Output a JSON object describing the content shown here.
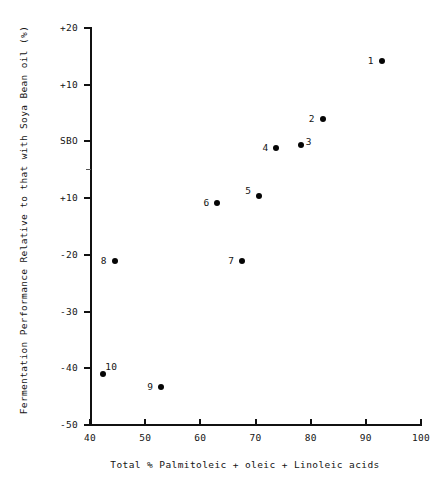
{
  "chart_data": {
    "type": "scatter",
    "title": "",
    "xlabel": "Total % Palmitoleic + oleic + Linoleic acids",
    "ylabel": "Fermentation Performance Relative to that with Soya Bean oil (%)",
    "xlim": [
      40,
      100
    ],
    "ylim": [
      -50,
      20
    ],
    "grid": false,
    "legend": null,
    "xticks": [
      {
        "value": 40,
        "label": "40"
      },
      {
        "value": 50,
        "label": "50"
      },
      {
        "value": 60,
        "label": "60"
      },
      {
        "value": 70,
        "label": "70"
      },
      {
        "value": 80,
        "label": "80"
      },
      {
        "value": 90,
        "label": "90"
      },
      {
        "value": 100,
        "label": "100"
      }
    ],
    "yticks": [
      {
        "value": 20,
        "label": "+20"
      },
      {
        "value": 10,
        "label": "+10"
      },
      {
        "value": 0,
        "label": "SBO"
      },
      {
        "value": -10,
        "label": "+10"
      },
      {
        "value": -20,
        "label": "-20"
      },
      {
        "value": -30,
        "label": "-30"
      },
      {
        "value": -40,
        "label": "-40"
      },
      {
        "value": -50,
        "label": "-50"
      }
    ],
    "y_minor_ticks": [
      -5
    ],
    "points": [
      {
        "label": "1",
        "x": 92.9,
        "y": 14.2,
        "label_side": "left"
      },
      {
        "label": "2",
        "x": 82.2,
        "y": 4.0,
        "label_side": "left"
      },
      {
        "label": "3",
        "x": 78.2,
        "y": -0.7,
        "label_side": "right"
      },
      {
        "label": "4",
        "x": 73.8,
        "y": -1.1,
        "label_side": "left"
      },
      {
        "label": "5",
        "x": 70.7,
        "y": -9.6,
        "label_side": "left-up"
      },
      {
        "label": "6",
        "x": 63.1,
        "y": -10.9,
        "label_side": "left"
      },
      {
        "label": "7",
        "x": 67.6,
        "y": -21.0,
        "label_side": "left"
      },
      {
        "label": "8",
        "x": 44.5,
        "y": -21.0,
        "label_side": "left"
      },
      {
        "label": "9",
        "x": 52.9,
        "y": -43.3,
        "label_side": "left"
      },
      {
        "label": "10",
        "x": 42.4,
        "y": -41.0,
        "label_side": "right-up"
      }
    ]
  }
}
